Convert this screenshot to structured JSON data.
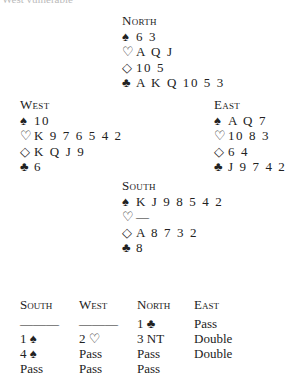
{
  "top_text": "West vulnerable",
  "suits": {
    "spades": "♠",
    "hearts": "♡",
    "diamonds": "◇",
    "clubs": "♣"
  },
  "hands": {
    "north": {
      "title": "North",
      "spades": "6 3",
      "hearts": "A Q J",
      "diamonds": "10 5",
      "clubs": "A K Q 10 5 3"
    },
    "west": {
      "title": "West",
      "spades": "10",
      "hearts": "K 9 7 6 5 4 2",
      "diamonds": "K Q J 9",
      "clubs": "6"
    },
    "east": {
      "title": "East",
      "spades": "A Q 7",
      "hearts": "10 8 3",
      "diamonds": "6 4",
      "clubs": "J 9 7 4 2"
    },
    "south": {
      "title": "South",
      "spades": "K J 9 8 5 4 2",
      "hearts": "—",
      "diamonds": "A 8 7 3 2",
      "clubs": "8"
    }
  },
  "auction": {
    "headers": [
      "South",
      "West",
      "North",
      "East"
    ],
    "rows": [
      [
        "———",
        "———",
        "1 ♣",
        "Pass"
      ],
      [
        "1 ♠",
        "2 ♡",
        "3 NT",
        "Double"
      ],
      [
        "4 ♠",
        "Pass",
        "Pass",
        "Double"
      ],
      [
        "Pass",
        "Pass",
        "Pass",
        ""
      ]
    ]
  }
}
